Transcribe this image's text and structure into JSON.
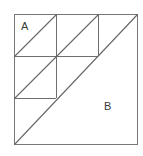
{
  "figure": {
    "type": "geometric-diagram",
    "labels": [
      {
        "id": "A",
        "text": "A",
        "x": 21,
        "y": 21,
        "region": "top-left-small-square"
      },
      {
        "id": "B",
        "text": "B",
        "x": 104,
        "y": 101,
        "region": "large-lower-right-triangle"
      }
    ],
    "colors": {
      "background": "#ffffff",
      "stroke": "#555555",
      "stroke_light": "#808080",
      "label": "#3a3a3a"
    },
    "stroke_width": 1,
    "outer_square": {
      "x1": 14,
      "y1": 14,
      "x2": 138,
      "y2": 145
    },
    "main_diagonal": {
      "x1": 14,
      "y1": 145,
      "x2": 138,
      "y2": 14
    },
    "grid_lines": [
      {
        "name": "vertical-mid",
        "x1": 56,
        "y1": 14,
        "x2": 56,
        "y2": 98
      },
      {
        "name": "horizontal-mid",
        "x1": 14,
        "y1": 56,
        "x2": 98,
        "y2": 56
      },
      {
        "name": "vertical-right-upper",
        "x1": 98,
        "y1": 14,
        "x2": 98,
        "y2": 56
      },
      {
        "name": "horizontal-lower-left",
        "x1": 14,
        "y1": 98,
        "x2": 56,
        "y2": 98
      }
    ],
    "cell_diagonals": [
      {
        "name": "diagonal-cell-A",
        "x1": 14,
        "y1": 56,
        "x2": 56,
        "y2": 14
      },
      {
        "name": "diagonal-cell-top-right",
        "x1": 56,
        "y1": 56,
        "x2": 98,
        "y2": 14
      },
      {
        "name": "diagonal-cell-lower-left",
        "x1": 14,
        "y1": 98,
        "x2": 56,
        "y2": 56
      }
    ]
  }
}
